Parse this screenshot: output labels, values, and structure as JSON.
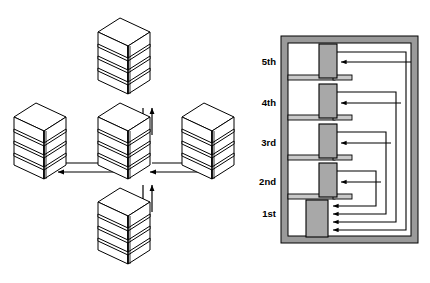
{
  "figure": {
    "title": "",
    "colors": {
      "stroke": "#000000",
      "shaft_fill": "#a8a8a8",
      "slab_fill": "#c9c9c9",
      "frame_fill": "#9a9a9a",
      "building_fill": "#ffffff",
      "background": "#ffffff"
    }
  },
  "left_diagram": {
    "name": "distributed-building-network",
    "description": "Five multi-storey buildings in a plus/cross arrangement with bidirectional arrows between the centre building and each of the four outer buildings.",
    "buildings": [
      {
        "id": "center",
        "label": "",
        "position": "center",
        "levels": 5,
        "x": 124,
        "y": 143
      },
      {
        "id": "north",
        "label": "",
        "position": "top",
        "levels": 5,
        "x": 124,
        "y": 58
      },
      {
        "id": "south",
        "label": "",
        "position": "bottom",
        "levels": 5,
        "x": 124,
        "y": 228
      },
      {
        "id": "west",
        "label": "",
        "position": "left",
        "levels": 5,
        "x": 40,
        "y": 143
      },
      {
        "id": "east",
        "label": "",
        "position": "right",
        "levels": 5,
        "x": 208,
        "y": 143
      }
    ],
    "links": [
      {
        "from": "center",
        "to": "north",
        "direction": "bidirectional"
      },
      {
        "from": "center",
        "to": "south",
        "direction": "bidirectional"
      },
      {
        "from": "center",
        "to": "west",
        "direction": "bidirectional"
      },
      {
        "from": "center",
        "to": "east",
        "direction": "bidirectional"
      }
    ]
  },
  "right_diagram": {
    "name": "building-floor-riser-section",
    "description": "Section through a five-storey building. Each upper floor has a vertical riser shaft; signal lines loop out to the right and return down to the ground-floor shaft, where four arrowheads converge.",
    "floors": [
      {
        "label": "5th",
        "order": 5,
        "y": 62,
        "slab_y": 78,
        "shaft_top": 44,
        "shaft_bottom": 78,
        "loop_x": 406,
        "arrow_y": 62
      },
      {
        "label": "4th",
        "order": 4,
        "y": 103,
        "slab_y": 118,
        "shaft_top": 85,
        "shaft_bottom": 118,
        "loop_x": 396,
        "arrow_y": 103
      },
      {
        "label": "3rd",
        "order": 3,
        "y": 143,
        "slab_y": 158,
        "shaft_top": 125,
        "shaft_bottom": 158,
        "loop_x": 386,
        "arrow_y": 143
      },
      {
        "label": "2nd",
        "order": 2,
        "y": 182,
        "slab_y": 197,
        "shaft_top": 165,
        "shaft_bottom": 197,
        "loop_x": 376,
        "arrow_y": 182
      },
      {
        "label": "1st",
        "order": 1,
        "y": 214,
        "slab_y": 240,
        "shaft_top": 200,
        "shaft_bottom": 240,
        "loop_x": 0,
        "arrow_y": 214
      }
    ],
    "ground_floor_arrow_ys": [
      206,
      214,
      222,
      230
    ],
    "frame": {
      "x": 281,
      "y": 36,
      "width": 137,
      "height": 207,
      "thickness": 7
    }
  }
}
